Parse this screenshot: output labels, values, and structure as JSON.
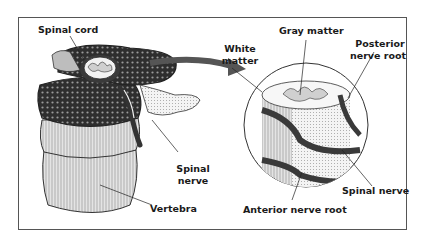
{
  "figure": {
    "labels": {
      "spinal_cord": "Spinal cord",
      "spinal_nerve_left_line1": "Spinal",
      "spinal_nerve_left_line2": "nerve",
      "vertebra": "Vertebra",
      "white_matter_line1": "White",
      "white_matter_line2": "matter",
      "gray_matter": "Gray matter",
      "posterior_root_line1": "Posterior",
      "posterior_root_line2": "nerve root",
      "spinal_nerve_right": "Spinal nerve",
      "anterior_root": "Anterior nerve root"
    },
    "colors": {
      "ink": "#1a1a1a",
      "bone_dark": "#3a3a3a",
      "bone_light": "#d9d9d9",
      "arrow": "#555555",
      "background": "#ffffff"
    }
  }
}
